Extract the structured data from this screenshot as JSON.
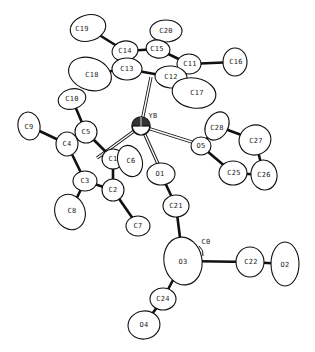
{
  "figure": {
    "type": "ORTEP molecular structure",
    "central_atom": "YB"
  },
  "atoms": [
    {
      "id": "C19",
      "label": "C19",
      "x": 88,
      "y": 28,
      "rx": 18,
      "ry": 13,
      "rot": -15,
      "lx": 82,
      "ly": 29
    },
    {
      "id": "C20",
      "label": "C20",
      "x": 166,
      "y": 31,
      "rx": 16,
      "ry": 11,
      "rot": 0,
      "lx": 166,
      "ly": 31
    },
    {
      "id": "C14",
      "label": "C14",
      "x": 125,
      "y": 51,
      "rx": 13,
      "ry": 10,
      "rot": -10,
      "lx": 125,
      "ly": 51
    },
    {
      "id": "C15",
      "label": "C15",
      "x": 158,
      "y": 49,
      "rx": 12,
      "ry": 9,
      "rot": 10,
      "lx": 157,
      "ly": 49
    },
    {
      "id": "C16",
      "label": "C16",
      "x": 235,
      "y": 62,
      "rx": 12,
      "ry": 14,
      "rot": 0,
      "lx": 236,
      "ly": 62
    },
    {
      "id": "C11",
      "label": "C11",
      "x": 189,
      "y": 64,
      "rx": 12,
      "ry": 10,
      "rot": 0,
      "lx": 190,
      "ly": 64
    },
    {
      "id": "C13",
      "label": "C13",
      "x": 127,
      "y": 69,
      "rx": 15,
      "ry": 11,
      "rot": 0,
      "lx": 127,
      "ly": 69
    },
    {
      "id": "C12",
      "label": "C12",
      "x": 171,
      "y": 77,
      "rx": 16,
      "ry": 11,
      "rot": 5,
      "lx": 171,
      "ly": 77
    },
    {
      "id": "C18",
      "label": "C18",
      "x": 90,
      "y": 74,
      "rx": 22,
      "ry": 16,
      "rot": 20,
      "lx": 92,
      "ly": 75
    },
    {
      "id": "C17",
      "label": "C17",
      "x": 194,
      "y": 93,
      "rx": 22,
      "ry": 15,
      "rot": 10,
      "lx": 197,
      "ly": 93
    },
    {
      "id": "C10",
      "label": "C10",
      "x": 72,
      "y": 99,
      "rx": 14,
      "ry": 10,
      "rot": -15,
      "lx": 72,
      "ly": 99
    },
    {
      "id": "C9",
      "label": "C9",
      "x": 29,
      "y": 126,
      "rx": 11,
      "ry": 14,
      "rot": -10,
      "lx": 29,
      "ly": 127
    },
    {
      "id": "C5",
      "label": "C5",
      "x": 86,
      "y": 132,
      "rx": 11,
      "ry": 11,
      "rot": 0,
      "lx": 86,
      "ly": 132
    },
    {
      "id": "C4",
      "label": "C4",
      "x": 67,
      "y": 144,
      "rx": 11,
      "ry": 12,
      "rot": 0,
      "lx": 67,
      "ly": 144
    },
    {
      "id": "C28",
      "label": "C28",
      "x": 217,
      "y": 126,
      "rx": 15,
      "ry": 11,
      "rot": -60,
      "lx": 217,
      "ly": 128
    },
    {
      "id": "C27",
      "label": "C27",
      "x": 255,
      "y": 140,
      "rx": 16,
      "ry": 15,
      "rot": -20,
      "lx": 256,
      "ly": 141
    },
    {
      "id": "O5",
      "label": "O5",
      "x": 201,
      "y": 146,
      "rx": 10,
      "ry": 9,
      "rot": 0,
      "lx": 201,
      "ly": 146
    },
    {
      "id": "C1",
      "label": "C1",
      "x": 113,
      "y": 159,
      "rx": 11,
      "ry": 10,
      "rot": 0,
      "lx": 113,
      "ly": 159
    },
    {
      "id": "C6",
      "label": "C6",
      "x": 130,
      "y": 161,
      "rx": 12,
      "ry": 16,
      "rot": -20,
      "lx": 131,
      "ly": 161
    },
    {
      "id": "C25",
      "label": "C25",
      "x": 233,
      "y": 173,
      "rx": 14,
      "ry": 12,
      "rot": 0,
      "lx": 234,
      "ly": 173
    },
    {
      "id": "C26",
      "label": "C26",
      "x": 264,
      "y": 175,
      "rx": 13,
      "ry": 15,
      "rot": -10,
      "lx": 264,
      "ly": 175
    },
    {
      "id": "O1",
      "label": "O1",
      "x": 161,
      "y": 174,
      "rx": 14,
      "ry": 11,
      "rot": 0,
      "lx": 160,
      "ly": 174
    },
    {
      "id": "C3",
      "label": "C3",
      "x": 85,
      "y": 181,
      "rx": 12,
      "ry": 10,
      "rot": 0,
      "lx": 85,
      "ly": 181
    },
    {
      "id": "C2",
      "label": "C2",
      "x": 113,
      "y": 190,
      "rx": 11,
      "ry": 11,
      "rot": 0,
      "lx": 113,
      "ly": 190
    },
    {
      "id": "C8",
      "label": "C8",
      "x": 70,
      "y": 212,
      "rx": 15,
      "ry": 18,
      "rot": -20,
      "lx": 72,
      "ly": 211
    },
    {
      "id": "C21",
      "label": "C21",
      "x": 176,
      "y": 206,
      "rx": 13,
      "ry": 11,
      "rot": 0,
      "lx": 176,
      "ly": 206
    },
    {
      "id": "C7",
      "label": "C7",
      "x": 138,
      "y": 226,
      "rx": 12,
      "ry": 10,
      "rot": 0,
      "lx": 138,
      "ly": 226
    },
    {
      "id": "O3",
      "label": "O3",
      "x": 183,
      "y": 261,
      "rx": 19,
      "ry": 24,
      "rot": -10,
      "lx": 183,
      "ly": 262
    },
    {
      "id": "C22",
      "label": "C22",
      "x": 250,
      "y": 262,
      "rx": 14,
      "ry": 15,
      "rot": 0,
      "lx": 251,
      "ly": 262
    },
    {
      "id": "O2",
      "label": "O2",
      "x": 285,
      "y": 264,
      "rx": 14,
      "ry": 22,
      "rot": 0,
      "lx": 285,
      "ly": 265
    },
    {
      "id": "C24",
      "label": "C24",
      "x": 163,
      "y": 299,
      "rx": 13,
      "ry": 11,
      "rot": 0,
      "lx": 163,
      "ly": 299
    },
    {
      "id": "O4",
      "label": "O4",
      "x": 144,
      "y": 325,
      "rx": 16,
      "ry": 14,
      "rot": -10,
      "lx": 144,
      "ly": 325
    }
  ],
  "yb_atom": {
    "label": "YB",
    "x": 141,
    "y": 126,
    "r": 9,
    "lx": 153,
    "ly": 116
  },
  "c0_label": {
    "label": "C0",
    "x": 206,
    "y": 242
  },
  "bonds": [
    [
      "C19",
      "C14"
    ],
    [
      "C14",
      "C15"
    ],
    [
      "C15",
      "C20"
    ],
    [
      "C15",
      "C11"
    ],
    [
      "C11",
      "C16"
    ],
    [
      "C11",
      "C12"
    ],
    [
      "C12",
      "C13"
    ],
    [
      "C13",
      "C14"
    ],
    [
      "C13",
      "C18"
    ],
    [
      "C10",
      "C5"
    ],
    [
      "C9",
      "C4"
    ],
    [
      "C4",
      "C5"
    ],
    [
      "C5",
      "C1"
    ],
    [
      "C4",
      "C3"
    ],
    [
      "C3",
      "C2"
    ],
    [
      "C2",
      "C1"
    ],
    [
      "C1",
      "C6"
    ],
    [
      "C3",
      "C8"
    ],
    [
      "C2",
      "C7"
    ],
    [
      "O5",
      "C28"
    ],
    [
      "C28",
      "C27"
    ],
    [
      "C27",
      "C26"
    ],
    [
      "C26",
      "C25"
    ],
    [
      "C25",
      "O5"
    ],
    [
      "O1",
      "C21"
    ],
    [
      "C21",
      "O3"
    ],
    [
      "O3",
      "C22"
    ],
    [
      "C22",
      "O2"
    ],
    [
      "O3",
      "C24"
    ],
    [
      "C24",
      "O4"
    ]
  ],
  "coordination_bonds": [
    {
      "from": "YB",
      "x2": 151,
      "y2": 77
    },
    {
      "from": "YB",
      "x2": 195,
      "y2": 143
    },
    {
      "from": "YB",
      "x2": 159,
      "y2": 166
    },
    {
      "from": "YB",
      "x2": 97,
      "y2": 158
    }
  ]
}
